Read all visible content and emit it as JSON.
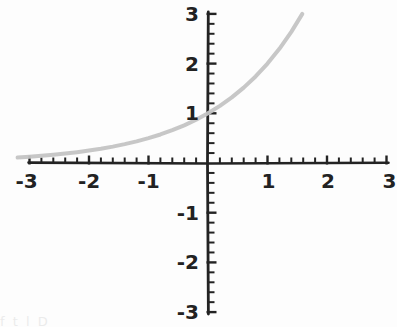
{
  "page": {
    "background_color": "#fdfdfd",
    "width": 397,
    "height": 327
  },
  "footer": {
    "partial_text": "f t  l  D"
  },
  "chart_data": {
    "type": "line",
    "title": "",
    "subtitle": "",
    "xlabel": "x",
    "ylabel": "y",
    "xlim": [
      -3,
      3
    ],
    "ylim": [
      -3,
      3
    ],
    "grid": false,
    "legend": null,
    "axis_style": "cartesian-cross",
    "x_tick_labels": [
      "-3",
      "-2",
      "-1",
      "1",
      "2",
      "3"
    ],
    "x_tick_values": [
      -3,
      -2,
      -1,
      1,
      2,
      3
    ],
    "y_tick_labels": [
      "3",
      "2",
      "1",
      "-1",
      "-2",
      "-3"
    ],
    "y_tick_values": [
      3,
      2,
      1,
      -1,
      -2,
      -3
    ],
    "minor_ticks_per_unit": 5,
    "series": [
      {
        "name": "y = 2^x",
        "color": "#c4c4c4",
        "line_width": 4,
        "x": [
          -3.2,
          -3.0,
          -2.8,
          -2.6,
          -2.4,
          -2.2,
          -2.0,
          -1.8,
          -1.6,
          -1.4,
          -1.2,
          -1.0,
          -0.8,
          -0.6,
          -0.4,
          -0.2,
          0.0,
          0.2,
          0.4,
          0.6,
          0.8,
          1.0,
          1.2,
          1.4,
          1.585
        ],
        "values": [
          0.109,
          0.125,
          0.144,
          0.165,
          0.189,
          0.218,
          0.25,
          0.287,
          0.33,
          0.379,
          0.435,
          0.5,
          0.574,
          0.66,
          0.758,
          0.871,
          1.0,
          1.149,
          1.32,
          1.516,
          1.741,
          2.0,
          2.297,
          2.639,
          3.0
        ]
      }
    ],
    "annotations": [
      {
        "text": "y",
        "x": -0.28,
        "y": 1.38
      },
      {
        "text": "x",
        "x": 1.42,
        "y": -0.55
      }
    ]
  }
}
